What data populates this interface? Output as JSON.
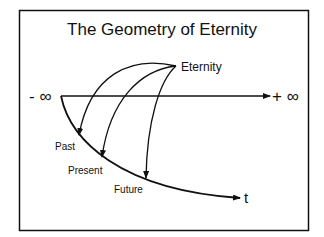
{
  "title": "The Geometry of Eternity",
  "labels": {
    "eternity": "Eternity",
    "neg_inf": "- ∞",
    "pos_inf": "+ ∞",
    "past": "Past",
    "present": "Present",
    "future": "Future",
    "t": "t"
  }
}
